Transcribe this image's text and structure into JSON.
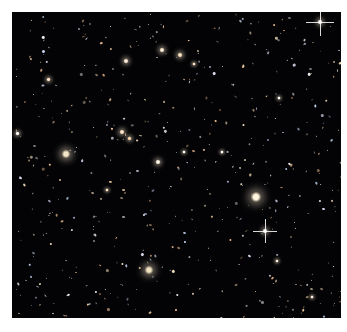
{
  "image": {
    "subject": "deep-field galaxy image",
    "background_color": "#030305",
    "border_color": "#ffffff"
  },
  "bright_objects": [
    {
      "x": 54,
      "y": 142,
      "r": 5,
      "color": "#f2e6c8",
      "kind": "elliptical-galaxy"
    },
    {
      "x": 244,
      "y": 185,
      "r": 6,
      "color": "#fff6e0",
      "kind": "bright-galaxy"
    },
    {
      "x": 137,
      "y": 258,
      "r": 5,
      "color": "#f0e2c0",
      "kind": "elliptical-galaxy"
    },
    {
      "x": 308,
      "y": 10,
      "r": 3,
      "color": "#ffffff",
      "kind": "star"
    },
    {
      "x": 253,
      "y": 219,
      "r": 3,
      "color": "#ffffff",
      "kind": "star"
    },
    {
      "x": 146,
      "y": 150,
      "r": 3,
      "color": "#fffbe8",
      "kind": "galaxy"
    },
    {
      "x": 114,
      "y": 49,
      "r": 3,
      "color": "#ffeedd",
      "kind": "galaxy"
    },
    {
      "x": 110,
      "y": 120,
      "r": 3,
      "color": "#ffe9c9",
      "kind": "galaxy"
    },
    {
      "x": 117,
      "y": 126,
      "r": 2.5,
      "color": "#ffd9b0",
      "kind": "galaxy"
    },
    {
      "x": 168,
      "y": 43,
      "r": 3,
      "color": "#ffe6c4",
      "kind": "galaxy"
    },
    {
      "x": 150,
      "y": 38,
      "r": 3,
      "color": "#fff0d8",
      "kind": "galaxy"
    },
    {
      "x": 5,
      "y": 121,
      "r": 2.5,
      "color": "#ffffff",
      "kind": "star"
    },
    {
      "x": 267,
      "y": 86,
      "r": 2,
      "color": "#ffffff",
      "kind": "star"
    },
    {
      "x": 172,
      "y": 140,
      "r": 2,
      "color": "#ffffff",
      "kind": "star"
    },
    {
      "x": 36,
      "y": 67,
      "r": 2.5,
      "color": "#ffe8c8",
      "kind": "galaxy"
    },
    {
      "x": 265,
      "y": 249,
      "r": 2,
      "color": "#fff2dd",
      "kind": "galaxy"
    },
    {
      "x": 210,
      "y": 140,
      "r": 2,
      "color": "#ffffff",
      "kind": "star"
    },
    {
      "x": 182,
      "y": 52,
      "r": 2,
      "color": "#ffe2c8",
      "kind": "galaxy"
    },
    {
      "x": 95,
      "y": 178,
      "r": 2,
      "color": "#ffe6c0",
      "kind": "galaxy"
    },
    {
      "x": 300,
      "y": 285,
      "r": 2,
      "color": "#fff0e0",
      "kind": "galaxy"
    }
  ],
  "diffraction_stars": [
    {
      "x": 308,
      "y": 10,
      "len": 14
    },
    {
      "x": 253,
      "y": 219,
      "len": 12
    }
  ],
  "faint_seed": 1337,
  "faint_count": 520
}
